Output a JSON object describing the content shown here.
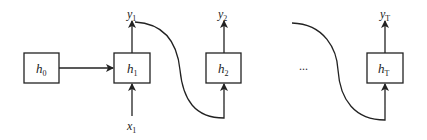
{
  "diagram": {
    "type": "unrolled-rnn",
    "nodes": [
      {
        "id": "h0",
        "base": "h",
        "sub": "0"
      },
      {
        "id": "h1",
        "base": "h",
        "sub": "1"
      },
      {
        "id": "h2",
        "base": "h",
        "sub": "2"
      },
      {
        "id": "hT",
        "base": "h",
        "sub": "T"
      }
    ],
    "outputs": [
      {
        "id": "y1",
        "base": "y",
        "sub": "1"
      },
      {
        "id": "y2",
        "base": "y",
        "sub": "2"
      },
      {
        "id": "yT",
        "base": "y",
        "sub": "T"
      }
    ],
    "inputs": [
      {
        "id": "x1",
        "base": "x",
        "sub": "1"
      }
    ],
    "ellipsis": "...",
    "edges": [
      {
        "from": "h0",
        "to": "h1"
      },
      {
        "from": "x1",
        "to": "h1"
      },
      {
        "from": "h1",
        "to": "y1"
      },
      {
        "from": "y1",
        "to": "h2",
        "style": "curve"
      },
      {
        "from": "h2",
        "to": "y2"
      },
      {
        "from": "...",
        "to": "hT",
        "style": "curve"
      },
      {
        "from": "hT",
        "to": "yT"
      }
    ]
  }
}
